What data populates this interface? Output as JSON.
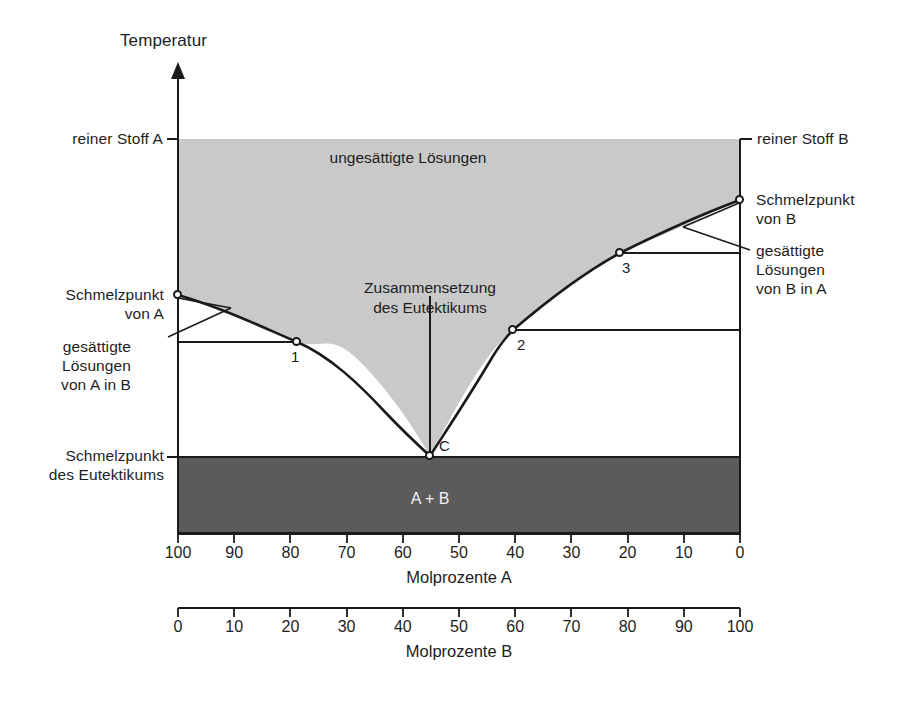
{
  "figure": {
    "title_y_axis": "Temperatur",
    "region_unsaturated": "ungesättigte Lösungen",
    "region_solid": "A + B",
    "eutectic_composition_label": "Zusammensetzung\ndes Eutektikums",
    "eutectic_point_label": "C",
    "pure_a_label": "reiner Stoff A",
    "pure_b_label": "reiner Stoff B",
    "melting_point_a_label": "Schmelzpunkt\nvon A",
    "melting_point_b_label": "Schmelzpunkt\nvon B",
    "saturated_a_in_b_label": "gesättigte\nLösungen\nvon A in B",
    "saturated_b_in_a_label": "gesättigte\nLösungen\nvon B in A",
    "melting_point_eutectic_label": "Schmelzpunkt\ndes Eutektikums",
    "point_1": "1",
    "point_2": "2",
    "point_3": "3"
  },
  "axes": {
    "x_top": {
      "title": "Molprozente A",
      "ticks": [
        "100",
        "90",
        "80",
        "70",
        "60",
        "50",
        "40",
        "30",
        "20",
        "10",
        "0"
      ]
    },
    "x_bottom": {
      "title": "Molprozente B",
      "ticks": [
        "0",
        "10",
        "20",
        "30",
        "40",
        "50",
        "60",
        "70",
        "80",
        "90",
        "100"
      ]
    }
  },
  "colors": {
    "unsaturated_region": "#c9c9c9",
    "solid_region": "#5b5b5b",
    "line": "#1a1a1a",
    "background": "#ffffff"
  },
  "chart_data": {
    "type": "line",
    "xlabel": "Molprozente A",
    "ylabel": "Temperatur",
    "xlim": [
      100,
      0
    ],
    "grid": false,
    "legend": "none",
    "annotations": [
      "ungesättigte Lösungen",
      "A + B",
      "Zusammensetzung des Eutektikums",
      "reiner Stoff A",
      "reiner Stoff B",
      "Schmelzpunkt von A",
      "Schmelzpunkt von B",
      "gesättigte Lösungen von A in B",
      "gesättigte Lösungen von B in A",
      "Schmelzpunkt des Eutektikums"
    ],
    "series": [
      {
        "name": "Liquiduskurve A (gesättigte Lösungen von A in B)",
        "x": [
          100,
          95,
          90,
          85,
          80,
          75,
          70,
          65,
          60,
          55
        ],
        "y": [
          0.605,
          0.575,
          0.545,
          0.512,
          0.478,
          0.437,
          0.389,
          0.33,
          0.25,
          0.195
        ]
      },
      {
        "name": "Liquiduskurve B (gesättigte Lösungen von B in A)",
        "x": [
          55,
          50,
          45,
          40,
          35,
          30,
          25,
          20,
          15,
          10,
          5,
          0
        ],
        "y": [
          0.195,
          0.268,
          0.372,
          0.446,
          0.506,
          0.558,
          0.604,
          0.648,
          0.692,
          0.735,
          0.777,
          0.848
        ]
      }
    ],
    "points": [
      {
        "label": "1",
        "x": 81,
        "y": 0.485,
        "note": "gesättigte Lösung von A in B"
      },
      {
        "label": "2",
        "x": 40,
        "y": 0.515,
        "note": "gesättigte Lösung von B in A"
      },
      {
        "label": "3",
        "x": 20,
        "y": 0.71,
        "note": "gesättigte Lösung von B in A"
      },
      {
        "label": "C",
        "x": 55,
        "y": 0.195,
        "note": "Eutektikum"
      },
      {
        "label": "Schmelzpunkt von A",
        "x": 100,
        "y": 0.605
      },
      {
        "label": "Schmelzpunkt von B",
        "x": 0,
        "y": 0.848
      }
    ],
    "horizontal_lines": [
      {
        "name": "Schmelzpunkt des Eutektikums",
        "y": 0.193
      },
      {
        "name": "reiner Stoff A / reiner Stoff B (Oberkante)",
        "y": 1.0
      }
    ]
  }
}
